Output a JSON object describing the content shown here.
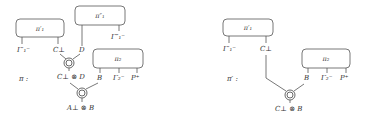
{
  "left_diagram": {
    "name": "π :",
    "boxes": {
      "pi1p": "π′₁",
      "pi1pp": "π″₁",
      "pi2": "π₂"
    },
    "labels": {
      "gamma1p": "Γ′₁⁻",
      "c_perp": "C⊥",
      "d": "D",
      "gamma1pp": "Γ″₁⁻",
      "b": "B",
      "gamma2": "Γ₂⁻",
      "p": "P⁺",
      "c_tensor_d": "C⊥ ⊗ D",
      "a_tensor_b": "A⊥ ⊗ B"
    },
    "node_glyph": "⊗"
  },
  "right_diagram": {
    "name": "π′ :",
    "boxes": {
      "pi1p": "π′₁",
      "pi2": "π₂"
    },
    "labels": {
      "gamma1p": "Γ′₁⁻",
      "c_perp": "C⊥",
      "b": "B",
      "gamma2": "Γ₂⁻",
      "p": "P⁺",
      "c_tensor_b": "C⊥ ⊗ B"
    },
    "node_glyph": "⊗"
  }
}
